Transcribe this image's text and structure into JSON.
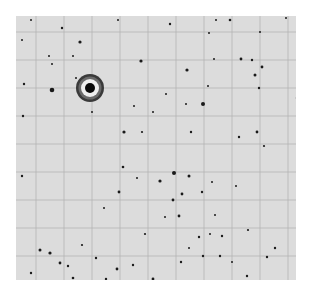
{
  "image": {
    "description": "Negative photographic star plate with overlaid reference grid",
    "background": "#ffffff",
    "plate": {
      "x": 16,
      "y": 16,
      "width": 280,
      "height": 264,
      "color": "#dcdcdc"
    },
    "grid": {
      "color": "#b4b4b4",
      "spacing_x": 28,
      "spacing_y": 28
    },
    "bright_star": {
      "cx": 74,
      "cy": 72,
      "core_r": 5,
      "halo_inner_r": 9,
      "halo_outer_r": 14
    },
    "stars": [
      [
        15,
        4,
        1
      ],
      [
        46,
        12,
        1.2
      ],
      [
        64,
        26,
        1.6
      ],
      [
        102,
        4,
        1
      ],
      [
        154,
        8,
        1.2
      ],
      [
        200,
        4,
        1
      ],
      [
        214,
        4,
        1.3
      ],
      [
        270,
        2,
        1
      ],
      [
        57,
        40,
        1
      ],
      [
        6,
        24,
        1
      ],
      [
        125,
        45,
        1.6
      ],
      [
        33,
        40,
        1
      ],
      [
        36,
        48,
        1
      ],
      [
        193,
        17,
        1
      ],
      [
        244,
        16,
        1
      ],
      [
        198,
        43,
        1
      ],
      [
        225,
        43,
        1.4
      ],
      [
        236,
        44,
        1.2
      ],
      [
        246,
        51,
        1.4
      ],
      [
        8,
        68,
        1.2
      ],
      [
        36,
        74,
        2.3
      ],
      [
        60,
        62,
        1
      ],
      [
        76,
        96,
        1
      ],
      [
        118,
        90,
        1
      ],
      [
        108,
        116,
        1.6
      ],
      [
        7,
        100,
        1.2
      ],
      [
        137,
        96,
        1
      ],
      [
        171,
        54,
        1.6
      ],
      [
        150,
        78,
        1
      ],
      [
        239,
        59,
        1.5
      ],
      [
        243,
        72,
        1.2
      ],
      [
        281,
        82,
        1.2
      ],
      [
        170,
        88,
        1
      ],
      [
        187,
        88,
        2
      ],
      [
        192,
        70,
        1
      ],
      [
        223,
        121,
        1.2
      ],
      [
        241,
        116,
        1.4
      ],
      [
        175,
        116,
        1.2
      ],
      [
        126,
        116,
        1.1
      ],
      [
        248,
        130,
        1.1
      ],
      [
        6,
        160,
        1.2
      ],
      [
        144,
        165,
        1.6
      ],
      [
        158,
        157,
        2
      ],
      [
        173,
        160,
        1.5
      ],
      [
        103,
        176,
        1.4
      ],
      [
        107,
        151,
        1.3
      ],
      [
        121,
        162,
        1
      ],
      [
        166,
        178,
        1.4
      ],
      [
        157,
        184,
        1.4
      ],
      [
        163,
        200,
        1.4
      ],
      [
        186,
        176,
        1.2
      ],
      [
        196,
        166,
        1
      ],
      [
        206,
        220,
        1.2
      ],
      [
        204,
        240,
        1.2
      ],
      [
        232,
        214,
        1.1
      ],
      [
        251,
        241,
        1.2
      ],
      [
        231,
        260,
        1.2
      ],
      [
        259,
        232,
        1.2
      ],
      [
        24,
        234,
        1.5
      ],
      [
        34,
        237,
        1.6
      ],
      [
        44,
        247,
        1.4
      ],
      [
        52,
        250,
        1.2
      ],
      [
        57,
        262,
        1.3
      ],
      [
        15,
        257,
        1.2
      ],
      [
        90,
        263,
        1.2
      ],
      [
        101,
        253,
        1.4
      ],
      [
        117,
        249,
        1.2
      ],
      [
        126,
        270,
        1.3
      ],
      [
        137,
        263,
        1.4
      ],
      [
        183,
        221,
        1.2
      ],
      [
        187,
        240,
        1.2
      ],
      [
        194,
        218,
        1
      ],
      [
        184,
        270,
        1.4
      ],
      [
        165,
        246,
        1.2
      ],
      [
        173,
        232,
        1
      ],
      [
        220,
        170,
        1
      ],
      [
        149,
        201,
        1
      ],
      [
        88,
        192,
        1
      ],
      [
        66,
        229,
        1.1
      ],
      [
        80,
        242,
        1.2
      ],
      [
        129,
        218,
        1.1
      ],
      [
        199,
        199,
        1
      ],
      [
        216,
        246,
        1
      ]
    ]
  }
}
